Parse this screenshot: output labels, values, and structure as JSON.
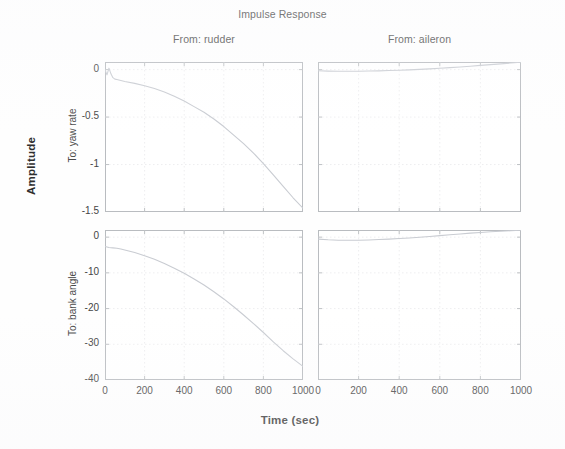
{
  "figure": {
    "title": "Impulse Response",
    "ylabel": "Amplitude",
    "xlabel": "Time (sec)",
    "column_titles": [
      "From: rudder",
      "From: aileron"
    ],
    "row_titles": [
      "To: yaw rate",
      "To: bank angle"
    ],
    "line_color": "#c9ccd2",
    "axis_color": "#b9bcc0",
    "grid_color": "#e6e7ea",
    "text_color": "#3c3c3c"
  },
  "axes": {
    "xticks": [
      "0",
      "200",
      "400",
      "600",
      "800",
      "1000"
    ],
    "xtick_values": [
      0,
      200,
      400,
      600,
      800,
      1000
    ],
    "xlim": [
      0,
      1000
    ],
    "row0_yticks": [
      "0",
      "-0.5",
      "-1",
      "-1.5"
    ],
    "row0_ytick_values": [
      0,
      -0.5,
      -1,
      -1.5
    ],
    "row0_ylim": [
      -1.5,
      0.08
    ],
    "row1_yticks": [
      "0",
      "-10",
      "-20",
      "-30",
      "-40"
    ],
    "row1_ytick_values": [
      0,
      -10,
      -20,
      -30,
      -40
    ],
    "row1_ylim": [
      -40,
      2
    ]
  },
  "chart_data": {
    "type": "line",
    "title": "Impulse Response",
    "xlabel": "Time (sec)",
    "ylabel": "Amplitude",
    "grid": true,
    "legend": "none",
    "layout": "2x2 subplot grid (MATLAB impulse response, MIMO system)",
    "columns": [
      "From: rudder",
      "From: aileron"
    ],
    "rows": [
      "To: yaw rate",
      "To: bank angle"
    ],
    "subplots": [
      {
        "row": "To: yaw rate",
        "column": "From: rudder",
        "xlim": [
          0,
          1000
        ],
        "ylim": [
          -1.5,
          0.08
        ],
        "xticks": [
          0,
          200,
          400,
          600,
          800,
          1000
        ],
        "yticks": [
          0,
          -0.5,
          -1,
          -1.5
        ],
        "x": [
          0,
          10,
          20,
          30,
          40,
          50,
          60,
          80,
          100,
          150,
          200,
          250,
          300,
          350,
          400,
          450,
          500,
          550,
          600,
          650,
          700,
          750,
          800,
          850,
          900,
          950,
          1000
        ],
        "y": [
          0,
          -0.055,
          0.015,
          -0.045,
          -0.085,
          -0.1,
          -0.105,
          -0.115,
          -0.125,
          -0.145,
          -0.17,
          -0.2,
          -0.235,
          -0.28,
          -0.33,
          -0.39,
          -0.45,
          -0.52,
          -0.6,
          -0.69,
          -0.78,
          -0.88,
          -0.99,
          -1.11,
          -1.23,
          -1.35,
          -1.46
        ]
      },
      {
        "row": "To: yaw rate",
        "column": "From: aileron",
        "xlim": [
          0,
          1000
        ],
        "ylim": [
          -1.5,
          0.08
        ],
        "xticks": [
          0,
          200,
          400,
          600,
          800,
          1000
        ],
        "yticks": [
          0,
          -0.5,
          -1,
          -1.5
        ],
        "x": [
          0,
          50,
          100,
          150,
          200,
          250,
          300,
          350,
          400,
          450,
          500,
          550,
          600,
          650,
          700,
          750,
          800,
          850,
          900,
          950,
          1000
        ],
        "y": [
          -0.012,
          -0.016,
          -0.018,
          -0.018,
          -0.017,
          -0.015,
          -0.013,
          -0.01,
          -0.007,
          -0.003,
          0.002,
          0.008,
          0.014,
          0.021,
          0.028,
          0.036,
          0.044,
          0.052,
          0.06,
          0.069,
          0.078
        ]
      },
      {
        "row": "To: bank angle",
        "column": "From: rudder",
        "xlim": [
          0,
          1000
        ],
        "ylim": [
          -40,
          2
        ],
        "xticks": [
          0,
          200,
          400,
          600,
          800,
          1000
        ],
        "yticks": [
          0,
          -10,
          -20,
          -30,
          -40
        ],
        "x": [
          0,
          20,
          40,
          60,
          80,
          100,
          150,
          200,
          250,
          300,
          350,
          400,
          450,
          500,
          550,
          600,
          650,
          700,
          750,
          800,
          850,
          900,
          950,
          1000
        ],
        "y": [
          -2.6,
          -2.9,
          -3.0,
          -3.1,
          -3.3,
          -3.6,
          -4.3,
          -5.2,
          -6.2,
          -7.4,
          -8.7,
          -10.1,
          -11.7,
          -13.4,
          -15.3,
          -17.3,
          -19.5,
          -21.8,
          -24.2,
          -26.7,
          -29.3,
          -31.8,
          -34.1,
          -36.2
        ]
      },
      {
        "row": "To: bank angle",
        "column": "From: aileron",
        "xlim": [
          0,
          1000
        ],
        "ylim": [
          -40,
          2
        ],
        "xticks": [
          0,
          200,
          400,
          600,
          800,
          1000
        ],
        "yticks": [
          0,
          -10,
          -20,
          -30,
          -40
        ],
        "x": [
          0,
          50,
          100,
          150,
          200,
          250,
          300,
          350,
          400,
          450,
          500,
          550,
          600,
          650,
          700,
          750,
          800,
          850,
          900,
          950,
          1000
        ],
        "y": [
          -0.55,
          -0.75,
          -0.85,
          -0.88,
          -0.85,
          -0.78,
          -0.68,
          -0.55,
          -0.4,
          -0.22,
          -0.02,
          0.2,
          0.42,
          0.66,
          0.9,
          1.12,
          1.32,
          1.5,
          1.66,
          1.8,
          1.92
        ]
      }
    ]
  }
}
